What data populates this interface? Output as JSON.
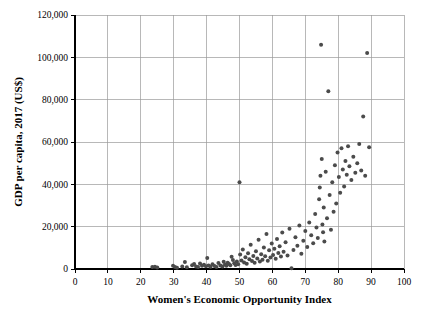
{
  "chart_data": {
    "type": "scatter",
    "title": "",
    "xlabel": "Women's Economic Opportunity Index",
    "ylabel": "GDP per capita, 2017 (US$)",
    "xlim": [
      0,
      100
    ],
    "ylim": [
      0,
      120000
    ],
    "xticks": [
      0,
      10,
      20,
      30,
      40,
      50,
      60,
      70,
      80,
      90,
      100
    ],
    "yticks": [
      0,
      20000,
      40000,
      60000,
      80000,
      100000,
      120000
    ],
    "xtick_labels": [
      "0",
      "10",
      "20",
      "30",
      "40",
      "50",
      "60",
      "70",
      "80",
      "90",
      "100"
    ],
    "ytick_labels": [
      "0",
      "20,000",
      "40,000",
      "60,000",
      "80,000",
      "100,000",
      "120,000"
    ],
    "grid": true,
    "legend": false,
    "marker_color": "#4b4b4b",
    "marker_size": 2.0,
    "series": [
      {
        "name": "Countries",
        "points": [
          [
            23.5,
            900
          ],
          [
            24.3,
            1100
          ],
          [
            25.0,
            700
          ],
          [
            29.8,
            1500
          ],
          [
            30.4,
            900
          ],
          [
            31.0,
            600
          ],
          [
            32.6,
            1200
          ],
          [
            33.4,
            3300
          ],
          [
            34.0,
            800
          ],
          [
            35.6,
            1800
          ],
          [
            36.2,
            2400
          ],
          [
            36.8,
            1200
          ],
          [
            37.4,
            1000
          ],
          [
            38.0,
            2600
          ],
          [
            38.6,
            1500
          ],
          [
            39.2,
            2000
          ],
          [
            39.8,
            1300
          ],
          [
            40.2,
            5200
          ],
          [
            40.6,
            1600
          ],
          [
            41.2,
            1100
          ],
          [
            41.8,
            2300
          ],
          [
            42.4,
            1400
          ],
          [
            43.0,
            900
          ],
          [
            43.6,
            2800
          ],
          [
            44.2,
            1700
          ],
          [
            44.8,
            1200
          ],
          [
            45.2,
            3400
          ],
          [
            45.6,
            2100
          ],
          [
            46.0,
            1500
          ],
          [
            46.4,
            3000
          ],
          [
            46.8,
            2400
          ],
          [
            47.2,
            1800
          ],
          [
            47.6,
            5800
          ],
          [
            48.0,
            4200
          ],
          [
            48.4,
            2700
          ],
          [
            48.8,
            1900
          ],
          [
            49.2,
            3600
          ],
          [
            49.6,
            2200
          ],
          [
            50.0,
            41000
          ],
          [
            50.2,
            6800
          ],
          [
            50.6,
            4000
          ],
          [
            51.0,
            9200
          ],
          [
            51.4,
            3100
          ],
          [
            51.8,
            5600
          ],
          [
            52.2,
            2500
          ],
          [
            52.6,
            7400
          ],
          [
            53.0,
            4600
          ],
          [
            53.4,
            11500
          ],
          [
            53.8,
            3800
          ],
          [
            54.2,
            6200
          ],
          [
            54.6,
            2900
          ],
          [
            55.0,
            8400
          ],
          [
            55.4,
            5000
          ],
          [
            55.8,
            13800
          ],
          [
            56.2,
            3500
          ],
          [
            56.6,
            7000
          ],
          [
            57.0,
            4400
          ],
          [
            57.4,
            10200
          ],
          [
            57.8,
            6000
          ],
          [
            58.2,
            16500
          ],
          [
            58.6,
            3900
          ],
          [
            59.0,
            8800
          ],
          [
            59.4,
            5400
          ],
          [
            59.8,
            12000
          ],
          [
            60.2,
            6600
          ],
          [
            60.6,
            9600
          ],
          [
            61.0,
            4800
          ],
          [
            61.4,
            14200
          ],
          [
            61.8,
            7600
          ],
          [
            62.2,
            10800
          ],
          [
            62.6,
            5900
          ],
          [
            63.0,
            17200
          ],
          [
            63.4,
            8200
          ],
          [
            64.0,
            12600
          ],
          [
            64.6,
            6400
          ],
          [
            65.2,
            19000
          ],
          [
            65.8,
            300
          ],
          [
            66.4,
            9000
          ],
          [
            67.0,
            15000
          ],
          [
            67.6,
            11000
          ],
          [
            68.2,
            20500
          ],
          [
            68.8,
            7200
          ],
          [
            69.4,
            13400
          ],
          [
            70.0,
            18000
          ],
          [
            70.6,
            10400
          ],
          [
            71.2,
            22000
          ],
          [
            71.8,
            16000
          ],
          [
            72.4,
            12200
          ],
          [
            73.0,
            26000
          ],
          [
            73.4,
            19600
          ],
          [
            73.8,
            14600
          ],
          [
            74.2,
            33000
          ],
          [
            74.4,
            38500
          ],
          [
            74.6,
            44000
          ],
          [
            74.8,
            106000
          ],
          [
            75.0,
            52000
          ],
          [
            75.2,
            21000
          ],
          [
            75.4,
            17400
          ],
          [
            75.6,
            29000
          ],
          [
            75.8,
            13000
          ],
          [
            76.2,
            46000
          ],
          [
            76.6,
            24000
          ],
          [
            77.0,
            84000
          ],
          [
            77.4,
            35000
          ],
          [
            77.8,
            18600
          ],
          [
            78.2,
            41000
          ],
          [
            78.6,
            27000
          ],
          [
            79.0,
            49000
          ],
          [
            79.4,
            31000
          ],
          [
            79.8,
            55000
          ],
          [
            80.2,
            43500
          ],
          [
            80.6,
            36000
          ],
          [
            81.0,
            57000
          ],
          [
            81.4,
            47000
          ],
          [
            81.8,
            39000
          ],
          [
            82.2,
            51000
          ],
          [
            82.6,
            44500
          ],
          [
            83.0,
            58000
          ],
          [
            83.4,
            48500
          ],
          [
            84.0,
            42000
          ],
          [
            84.6,
            53000
          ],
          [
            85.2,
            45500
          ],
          [
            85.8,
            50000
          ],
          [
            86.4,
            59000
          ],
          [
            87.0,
            46500
          ],
          [
            87.6,
            72000
          ],
          [
            88.2,
            44000
          ],
          [
            88.8,
            102000
          ],
          [
            89.4,
            57500
          ]
        ]
      }
    ]
  },
  "plot_geometry": {
    "left_px": 75,
    "right_px": 404,
    "top_px": 15,
    "bottom_px": 269
  }
}
